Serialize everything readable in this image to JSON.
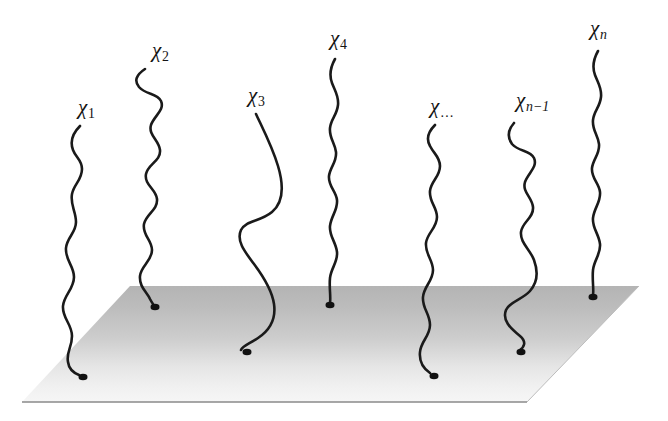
{
  "figure": {
    "background_color": "#ffffff",
    "width": 668,
    "height": 421
  },
  "surface": {
    "name": "grafting-plane",
    "shape": "parallelogram",
    "gradient_top_color": "#b6b6b6",
    "gradient_bottom_color": "#f4f4f4",
    "edge_line_color": "#8a8a8a",
    "corners": {
      "top_left": [
        130,
        286
      ],
      "top_right": [
        639,
        286
      ],
      "bottom_right": [
        527,
        402
      ],
      "bottom_left": [
        22,
        402
      ]
    }
  },
  "chains": [
    {
      "id": "chi-1",
      "label_base": "χ",
      "label_sub": "1",
      "label_sub_style": "plain",
      "label_x": 78,
      "label_y": 97,
      "anchor_point": [
        83,
        377
      ],
      "stroke_color": "#1a1a1a",
      "path": "M 80,126 C 72,134 70,142 73,150 C 76,158 82,160 82,169 C 82,180 74,184 72,194 C 70,205 76,211 76,222 C 76,233 67,237 66,248 C 65,260 74,266 74,277 C 74,289 64,295 63,306 C 62,318 72,324 72,336 C 72,348 66,352 68,362 C 69,370 74,373 79,375"
    },
    {
      "id": "chi-2",
      "label_base": "χ",
      "label_sub": "2",
      "label_sub_style": "plain",
      "label_x": 152,
      "label_y": 40,
      "anchor_point": [
        155,
        307
      ],
      "stroke_color": "#1a1a1a",
      "path": "M 145,69 C 136,75 134,81 139,87 C 146,95 157,93 161,101 C 165,110 154,116 151,125 C 148,135 159,140 160,150 C 161,161 148,164 146,174 C 144,185 156,189 157,199 C 158,210 146,214 144,224 C 142,235 152,240 152,250 C 152,261 141,266 140,276 C 139,287 147,292 150,299 C 152,303 154,305 154,306"
    },
    {
      "id": "chi-3",
      "label_base": "χ",
      "label_sub": "3",
      "label_sub_style": "plain",
      "label_x": 248,
      "label_y": 85,
      "anchor_point": [
        247,
        352
      ],
      "stroke_color": "#1a1a1a",
      "path": "M 256,114 C 262,127 272,146 278,166 C 284,186 284,202 272,212 C 260,222 246,220 241,230 C 236,241 245,252 254,264 C 263,276 272,290 274,304 C 276,318 270,330 258,338 C 249,344 242,346 241,350"
    },
    {
      "id": "chi-4",
      "label_base": "χ",
      "label_sub": "4",
      "label_sub_style": "plain",
      "label_x": 330,
      "label_y": 28,
      "anchor_point": [
        330,
        305
      ],
      "stroke_color": "#1a1a1a",
      "path": "M 335,59 C 330,68 329,75 332,83 C 335,91 339,96 338,105 C 337,115 331,119 330,128 C 329,138 335,143 336,152 C 337,162 330,167 329,176 C 328,186 336,191 337,200 C 338,210 331,216 330,226 C 329,236 336,242 337,252 C 338,262 331,268 330,278 C 329,288 331,296 330,303"
    },
    {
      "id": "chi-dots",
      "label_base": "χ",
      "label_sub": "…",
      "label_sub_style": "dots",
      "label_x": 430,
      "label_y": 96,
      "anchor_point": [
        434,
        376
      ],
      "stroke_color": "#1a1a1a",
      "path": "M 435,125 C 428,132 426,139 430,146 C 434,154 440,157 440,166 C 440,177 431,181 430,191 C 429,202 437,207 437,217 C 437,228 427,233 426,243 C 425,254 433,260 433,270 C 433,281 424,286 423,297 C 422,308 430,314 430,325 C 430,336 421,341 420,352 C 419,362 424,369 430,373"
    },
    {
      "id": "chi-n-minus-1",
      "label_base": "χ",
      "label_sub": "n−1",
      "label_sub_style": "italic",
      "label_x": 516,
      "label_y": 90,
      "anchor_point": [
        521,
        352
      ],
      "stroke_color": "#1a1a1a",
      "path": "M 514,123 C 508,130 507,137 512,144 C 519,152 530,150 534,158 C 538,167 528,173 525,182 C 522,192 532,197 533,207 C 534,218 522,222 521,232 C 520,243 530,249 534,260 C 538,271 538,282 530,291 C 522,300 510,301 506,310 C 502,320 510,328 520,336 C 527,342 524,347 520,350"
    },
    {
      "id": "chi-n",
      "label_base": "χ",
      "label_sub": "n",
      "label_sub_style": "italic",
      "label_x": 590,
      "label_y": 18,
      "anchor_point": [
        593,
        297
      ],
      "stroke_color": "#1a1a1a",
      "path": "M 598,51 C 593,60 592,67 595,75 C 598,83 602,88 601,97 C 600,107 594,111 593,120 C 592,130 598,135 599,144 C 600,154 593,159 592,168 C 591,178 599,183 600,192 C 601,202 594,208 593,218 C 592,228 599,234 600,244 C 601,254 594,260 593,270 C 592,280 594,289 593,295"
    }
  ],
  "anchor_dot": {
    "name": "graft-point",
    "color": "#111111",
    "radius_x": 4.5,
    "radius_y": 3.2
  }
}
